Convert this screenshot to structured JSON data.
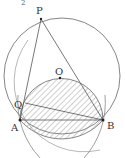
{
  "figure": {
    "type": "geometry-diagram",
    "top_fragment": "2",
    "points": {
      "P": {
        "label": "P",
        "x": 41,
        "y": 19
      },
      "O": {
        "label": "O",
        "x": 60,
        "y": 78
      },
      "Q": {
        "label": "Q",
        "x": 25,
        "y": 103
      },
      "A": {
        "label": "A",
        "x": 20,
        "y": 120
      },
      "B": {
        "label": "B",
        "x": 103,
        "y": 120
      }
    },
    "segments": [
      "PA",
      "PB",
      "AB",
      "QB"
    ],
    "hatched_region": "circle on chord AB (hatched)",
    "colors": {
      "stroke": "#555555",
      "hatch": "#888888",
      "point": "#222222"
    }
  }
}
